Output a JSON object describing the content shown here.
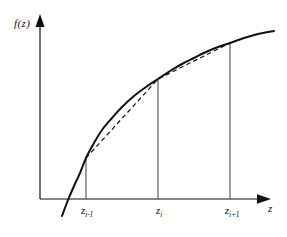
{
  "figure": {
    "title": "",
    "background_color": "#ffffff",
    "line_color": "#111111",
    "width": 287,
    "height": 237
  },
  "axes": {
    "y_label": "f(z)",
    "x_label": "z",
    "origin": {
      "x": 40,
      "y": 199
    },
    "x_axis_end": {
      "x": 268,
      "y": 199
    },
    "y_axis_top": {
      "x": 40,
      "y": 18
    },
    "arrow_x": "right-arrow-head",
    "arrow_y": "up-arrow-head"
  },
  "ticks": [
    {
      "id": "tick-0",
      "label_main": "z",
      "label_sub": "i-1",
      "x": 87
    },
    {
      "id": "tick-1",
      "label_main": "z",
      "label_sub": "i",
      "x": 159
    },
    {
      "id": "tick-2",
      "label_main": "z",
      "label_sub": "i+1",
      "x": 232
    }
  ],
  "chart_data": {
    "type": "line",
    "title": "",
    "xlabel": "z",
    "ylabel": "f(z)",
    "grid": false,
    "legend": null,
    "xlim": [
      40,
      287
    ],
    "ylim": [
      0,
      237
    ],
    "series": [
      {
        "name": "f(z) curve",
        "style": "solid",
        "linewidth": 2.0,
        "color": "#111111",
        "points": [
          [
            62,
            216
          ],
          [
            68,
            200
          ],
          [
            74,
            186
          ],
          [
            80,
            173
          ],
          [
            86,
            158
          ],
          [
            94,
            143
          ],
          [
            102,
            130
          ],
          [
            112,
            118
          ],
          [
            122,
            107
          ],
          [
            134,
            96
          ],
          [
            146,
            87
          ],
          [
            158,
            79
          ],
          [
            170,
            71
          ],
          [
            182,
            64
          ],
          [
            194,
            58
          ],
          [
            206,
            52
          ],
          [
            218,
            47
          ],
          [
            230,
            43
          ],
          [
            244,
            38
          ],
          [
            258,
            34
          ],
          [
            274,
            31
          ]
        ]
      },
      {
        "name": "piecewise-linear chord",
        "style": "dashed",
        "linewidth": 1.2,
        "color": "#111111",
        "points": [
          [
            86,
            158
          ],
          [
            158,
            79
          ],
          [
            230,
            43
          ]
        ]
      }
    ],
    "nodes": [
      {
        "label": "z_(i-1)",
        "x": 86,
        "y": 158
      },
      {
        "label": "z_i",
        "x": 158,
        "y": 79
      },
      {
        "label": "z_(i+1)",
        "x": 230,
        "y": 43
      }
    ],
    "drop_lines": [
      {
        "x": 86,
        "y_top": 158,
        "y_bottom": 199
      },
      {
        "x": 158,
        "y_top": 79,
        "y_bottom": 199
      },
      {
        "x": 230,
        "y_top": 43,
        "y_bottom": 199
      }
    ]
  }
}
